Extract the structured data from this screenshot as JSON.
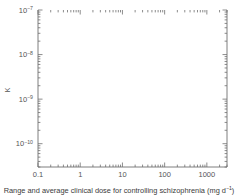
{
  "chart_data": {
    "type": "scatter",
    "title": "",
    "xlabel": "Range and average clinical dose for controlling schizophrenia (mg d⁻¹)",
    "ylabel": "K₅₀ (mol l⁻¹)",
    "ylabel_base": "K",
    "ylabel_sub": "50",
    "ylabel_unit": " (mol l",
    "ylabel_unit_sup": "−1",
    "ylabel_unit_end": ")",
    "xscale": "log",
    "yscale": "log",
    "xlim": [
      0.1,
      3000
    ],
    "ylim": [
      3e-11,
      1e-07
    ],
    "grid": false,
    "legend": "none",
    "xticks": [
      "0.1",
      "1",
      "10",
      "100",
      "1000"
    ],
    "xtick_values": [
      0.1,
      1,
      10,
      100,
      1000
    ],
    "yticks": [
      "10⁻⁷",
      "10⁻⁸",
      "10⁻⁹",
      "10⁻¹⁰"
    ],
    "ytick_values": [
      1e-07,
      1e-08,
      1e-09,
      1e-10
    ],
    "ytick_exponents": [
      "−7",
      "−8",
      "−9",
      "−10"
    ],
    "trendline": {
      "present": true,
      "x": [
        0.28,
        2200
      ],
      "y": [
        4.2e-11,
        7.5e-08
      ]
    },
    "points": [
      {
        "name": "Promazine",
        "x": 1400,
        "y": 5.5e-08,
        "xlow": 700,
        "xhigh": 2200,
        "errorbar": true,
        "label_dx": -6,
        "label_dy": -9,
        "anchor": "end"
      },
      {
        "name": "Chlorpromazine",
        "x": 520,
        "y": 2.9e-08,
        "xlow": 280,
        "xhigh": 900,
        "errorbar": true,
        "label_dx": -8,
        "label_dy": -6,
        "anchor": "end"
      },
      {
        "name": "Trazodone",
        "x": 400,
        "y": 2.4e-08,
        "xlow": 230,
        "xhigh": 700,
        "errorbar": true,
        "label_dx": -9,
        "label_dy": -4,
        "anchor": "end"
      },
      {
        "name": "Clozapine",
        "x": 620,
        "y": 2e-08,
        "xlow": 400,
        "xhigh": 900,
        "errorbar": true,
        "label_dx": 8,
        "label_dy": 3,
        "anchor": "start"
      },
      {
        "name": "Thioridazine",
        "x": 640,
        "y": 1.35e-08,
        "xlow": null,
        "xhigh": null,
        "errorbar": false,
        "label_dx": 8,
        "label_dy": 3,
        "anchor": "start"
      },
      {
        "name": "Molindone",
        "x": 130,
        "y": 8.8e-09,
        "xlow": 55,
        "xhigh": 230,
        "errorbar": true,
        "label_dx": -9,
        "label_dy": -2,
        "anchor": "end"
      },
      {
        "name": "Prochlorperazine",
        "x": 150,
        "y": 7.6e-09,
        "xlow": 70,
        "xhigh": 260,
        "errorbar": true,
        "label_dx": 9,
        "label_dy": 6,
        "anchor": "start"
      },
      {
        "name": "Moperone",
        "x": 42,
        "y": 3.9e-09,
        "xlow": 17,
        "xhigh": 70,
        "errorbar": true,
        "label_dx": 9,
        "label_dy": 2,
        "anchor": "start"
      },
      {
        "name": "Trifluperazine",
        "x": 33,
        "y": 3e-09,
        "xlow": 14,
        "xhigh": 60,
        "errorbar": true,
        "label_dx": 9,
        "label_dy": 4,
        "anchor": "start"
      },
      {
        "name": "Thiothixene",
        "x": 17,
        "y": 2.1e-09,
        "xlow": 8,
        "xhigh": 32,
        "errorbar": true,
        "label_dx": 9,
        "label_dy": 4,
        "anchor": "start"
      },
      {
        "name": "Haloperidol",
        "x": 11,
        "y": 1.15e-09,
        "xlow": 5,
        "xhigh": 22,
        "errorbar": true,
        "label_dx": 9,
        "label_dy": 3,
        "anchor": "start"
      },
      {
        "name": "Droperidol",
        "x": 10,
        "y": 1.05e-09,
        "xlow": 5,
        "xhigh": 20,
        "errorbar": true,
        "label_dx": -10,
        "label_dy": -1,
        "anchor": "end"
      },
      {
        "name": "Fluphenazine",
        "x": 7.0,
        "y": 8e-10,
        "xlow": 3.2,
        "xhigh": 14,
        "errorbar": true,
        "label_dx": 10,
        "label_dy": 8,
        "anchor": "start"
      },
      {
        "name": "Pimozide",
        "x": 3.2,
        "y": 4e-10,
        "xlow": 1.6,
        "xhigh": 7.0,
        "errorbar": true,
        "label_dx": -10,
        "label_dy": -1,
        "anchor": "end"
      },
      {
        "name": "Trifluperidol",
        "x": 3.4,
        "y": 3.7e-10,
        "xlow": 1.7,
        "xhigh": 7.5,
        "errorbar": true,
        "label_dx": 9,
        "label_dy": 7,
        "anchor": "start"
      },
      {
        "name": "Benperidol",
        "x": 1.5,
        "y": 1.8e-10,
        "xlow": 0.6,
        "xhigh": 3.2,
        "errorbar": true,
        "label_dx": 9,
        "label_dy": 3,
        "anchor": "start"
      },
      {
        "name": "Spiroperidol",
        "x": 0.45,
        "y": 6.6e-11,
        "xlow": 0.28,
        "xhigh": 0.75,
        "errorbar": true,
        "label_dx": 9,
        "label_dy": 3,
        "anchor": "start"
      }
    ]
  },
  "caption": {
    "text_before": "Range and average clinical dose for controlling schizophrenia (mg d",
    "sup": "−1",
    "text_after": ")"
  },
  "colors": {
    "axis": "#6f6f6f",
    "point": "#2b2b2b",
    "line": "#5a5a5a",
    "text": "#3a3a3a"
  }
}
